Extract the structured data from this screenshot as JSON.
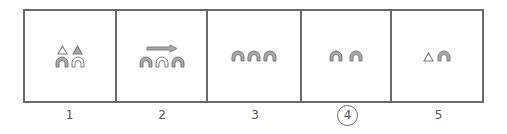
{
  "diagram": {
    "colors": {
      "border": "#6a6a6a",
      "shape_fill": "#a8a8a8",
      "shape_stroke": "#7a7a7a",
      "hollow_fill": "#ffffff",
      "label": "#555555"
    },
    "panels": [
      {
        "label": "1",
        "circled": false,
        "rows": [
          [
            {
              "shape": "triangle",
              "filled": false
            },
            {
              "shape": "triangle",
              "filled": true
            }
          ],
          [
            {
              "shape": "arch",
              "filled": true
            },
            {
              "shape": "arch",
              "filled": false
            }
          ]
        ]
      },
      {
        "label": "2",
        "circled": false,
        "arrow": "right",
        "rows": [
          [
            {
              "shape": "arch",
              "filled": true
            },
            {
              "shape": "arch",
              "filled": false
            },
            {
              "shape": "arch",
              "filled": true
            }
          ]
        ]
      },
      {
        "label": "3",
        "circled": false,
        "rows": [
          [
            {
              "shape": "arch",
              "filled": true
            },
            {
              "shape": "arch",
              "filled": true
            },
            {
              "shape": "arch",
              "filled": true
            }
          ]
        ]
      },
      {
        "label": "4",
        "circled": true,
        "rows": [
          [
            {
              "shape": "arch",
              "filled": true
            },
            {
              "shape": "arch",
              "filled": true
            }
          ]
        ]
      },
      {
        "label": "5",
        "circled": false,
        "rows": [
          [
            {
              "shape": "triangle",
              "filled": false
            },
            {
              "shape": "arch",
              "filled": true
            }
          ]
        ]
      }
    ]
  }
}
